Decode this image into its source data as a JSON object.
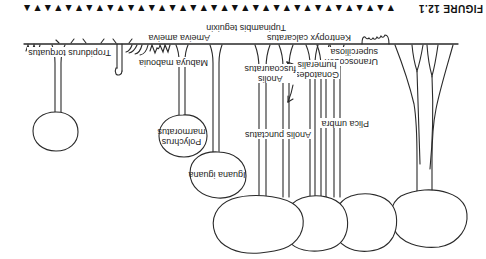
{
  "colors": {
    "ink": "#2a2a2a",
    "paper": "#ffffff"
  },
  "caption": {
    "text": "FIGURE 12.1",
    "ornament": "▼▲▼▲▼▲▼▲▼▲▼▲▼▲▼▲▼▲▼▲▼▲▼▲▼▲▼▲▼▲▼▲▼▲▼▲▼▲▼▲▼▲"
  },
  "species_labels": {
    "uranoscodon": {
      "line1": "Uranoscodon",
      "line2": "superciliosa"
    },
    "plica_umbra": {
      "line1": "Plica umbra"
    },
    "gonatodes": {
      "line1": "Gonatodes",
      "line2": "humeralis"
    },
    "anolis_fuscoauratus": {
      "line1": "Anolis",
      "line2": "fuscoauratus"
    },
    "anolis_punctatus": {
      "line1": "Anolis punctatus"
    },
    "iguana_iguana": {
      "line1": "Iguana iguana"
    },
    "polychrus": {
      "line1": "Polychrus",
      "line2": "marmoratus"
    },
    "mabuya": {
      "line1": "Mabuya mabouia"
    },
    "ameiva": {
      "line1": "Ameiva ameiva"
    },
    "kentropyx": {
      "line1": "Kentropyx calcaratus"
    },
    "tupinambis": {
      "line1": "Tupinambis teguixin"
    },
    "tropidurus": {
      "line1": "Tropidurus torquatus"
    }
  }
}
